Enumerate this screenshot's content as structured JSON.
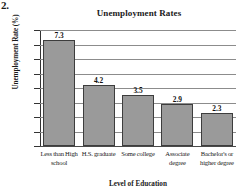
{
  "problem_number": "2.",
  "chart_data": {
    "type": "bar",
    "title": "Unemployment Rates",
    "xlabel": "Level of Education",
    "ylabel": "Unemployment Rate (%)",
    "categories": [
      "Less than High school",
      "H.S. graduate",
      "Some college",
      "Associate degree",
      "Bachelor's or higher degree"
    ],
    "values": [
      7.3,
      4.2,
      3.5,
      2.9,
      2.3
    ],
    "value_labels": [
      "7.3",
      "4.2",
      "3.5",
      "2.9",
      "2.3"
    ],
    "ylim": [
      0,
      8
    ],
    "yticks": [
      8,
      7,
      6,
      5,
      4,
      3,
      2,
      1,
      0
    ],
    "ytick_labels": [
      "8",
      "7",
      "6",
      "5",
      "4",
      "3",
      "2",
      "1",
      "0"
    ],
    "grid": true,
    "legend": "none",
    "bar_color": "#9a9a9a",
    "bar_border_color": "#3d3d3d",
    "gridline_color": "#8c8c8c",
    "axis_color": "#333333",
    "background": "#ffffff"
  }
}
